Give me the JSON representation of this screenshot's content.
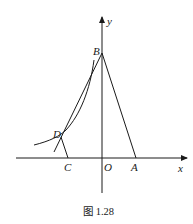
{
  "figure": {
    "caption": "图 1.28",
    "axes": {
      "x_label": "x",
      "y_label": "y"
    },
    "points": {
      "A": "A",
      "B": "B",
      "C": "C",
      "D": "D",
      "O": "O"
    },
    "colors": {
      "stroke": "#1a1a1a",
      "background": "#ffffff"
    }
  }
}
